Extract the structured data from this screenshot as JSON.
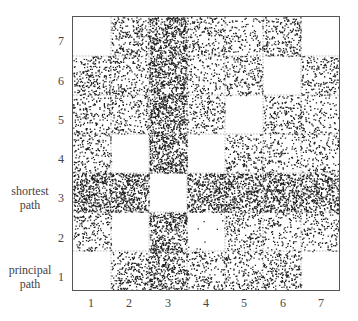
{
  "chart_data": {
    "type": "heatmap",
    "title": "",
    "xlabel": "",
    "ylabel": "",
    "x_ticks": [
      "1",
      "2",
      "3",
      "4",
      "5",
      "6",
      "7"
    ],
    "y_ticks": [
      "1",
      "2",
      "3",
      "4",
      "5",
      "6",
      "7"
    ],
    "y_annotations": [
      {
        "row": 3,
        "text": [
          "shortest",
          "path"
        ]
      },
      {
        "row": 1,
        "text": [
          "principal",
          "path"
        ]
      }
    ],
    "grid": true,
    "rows_top_to_bottom": [
      {
        "y": 7,
        "density": [
          0,
          0.45,
          0.9,
          0.4,
          0.25,
          0.45,
          0
        ]
      },
      {
        "y": 6,
        "density": [
          0.45,
          0.35,
          0.9,
          0.25,
          0.4,
          0,
          0.4
        ]
      },
      {
        "y": 5,
        "density": [
          0.35,
          0.35,
          0.9,
          0.35,
          0,
          0.4,
          0.25
        ]
      },
      {
        "y": 4,
        "density": [
          0.35,
          0,
          0.9,
          0,
          0.35,
          0.25,
          0.3
        ]
      },
      {
        "y": 3,
        "density": [
          0.9,
          0.9,
          0,
          0.85,
          0.8,
          0.85,
          0.75
        ]
      },
      {
        "y": 2,
        "density": [
          0.35,
          0,
          0.8,
          0.02,
          0.35,
          0.25,
          0.3
        ]
      },
      {
        "y": 1,
        "density": [
          0,
          0.45,
          0.75,
          0.35,
          0.35,
          0.45,
          0
        ]
      }
    ],
    "colors": {
      "dot": "#222222",
      "grid": "#888888",
      "frame": "#555555"
    }
  },
  "axes": {
    "x_ticks": [
      "1",
      "2",
      "3",
      "4",
      "5",
      "6",
      "7"
    ],
    "y_ticks": [
      "7",
      "6",
      "5",
      "4",
      "3",
      "2",
      "1"
    ],
    "shortest_path_label": [
      "shortest",
      "path"
    ],
    "principal_path_label": [
      "principal",
      "path"
    ]
  }
}
